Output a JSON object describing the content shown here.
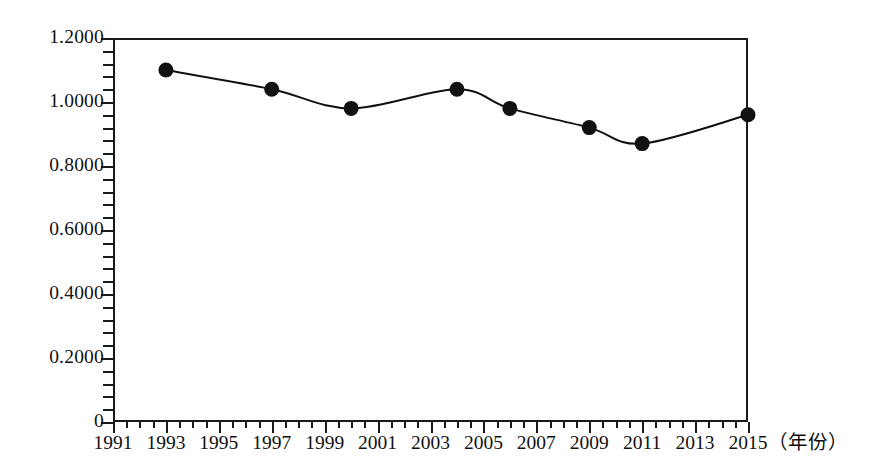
{
  "chart_data": {
    "type": "line",
    "title": "",
    "subtitle": "",
    "xlabel": "（年份）",
    "ylabel": "",
    "grid": true,
    "legend": false,
    "xlim": [
      1991,
      2015
    ],
    "ylim": [
      0,
      1.2
    ],
    "x": [
      1993,
      1997,
      2000,
      2004,
      2006,
      2009,
      2011,
      2015
    ],
    "values": [
      1.1,
      1.04,
      0.98,
      1.04,
      0.98,
      0.92,
      0.87,
      0.96
    ],
    "series": [
      {
        "name": "series-1",
        "x": [
          1993,
          1997,
          2000,
          2004,
          2006,
          2009,
          2011,
          2015
        ],
        "values": [
          1.1,
          1.04,
          0.98,
          1.04,
          0.98,
          0.92,
          0.87,
          0.96
        ],
        "marker": "filled-circle",
        "line_color": "#111111",
        "marker_color": "#111111"
      }
    ],
    "y_ticks": [
      {
        "value": 1.2,
        "label": "1.2000"
      },
      {
        "value": 1.0,
        "label": "1.0000"
      },
      {
        "value": 0.8,
        "label": "0.8000"
      },
      {
        "value": 0.6,
        "label": "0.6000"
      },
      {
        "value": 0.4,
        "label": "0.4000"
      },
      {
        "value": 0.2,
        "label": "0.2000"
      },
      {
        "value": 0.0,
        "label": "0"
      }
    ],
    "x_ticks": [
      {
        "value": 1991,
        "label": "1991"
      },
      {
        "value": 1993,
        "label": "1993"
      },
      {
        "value": 1995,
        "label": "1995"
      },
      {
        "value": 1997,
        "label": "1997"
      },
      {
        "value": 1999,
        "label": "1999"
      },
      {
        "value": 2001,
        "label": "2001"
      },
      {
        "value": 2003,
        "label": "2003"
      },
      {
        "value": 2005,
        "label": "2005"
      },
      {
        "value": 2007,
        "label": "2007"
      },
      {
        "value": 2009,
        "label": "2009"
      },
      {
        "value": 2011,
        "label": "2011"
      },
      {
        "value": 2013,
        "label": "2013"
      },
      {
        "value": 2015,
        "label": "2015"
      }
    ],
    "colors": {
      "axis": "#1a1a1a",
      "grid": "#2a2a2a",
      "line": "#111111",
      "marker": "#111111",
      "background": "#ffffff"
    }
  }
}
